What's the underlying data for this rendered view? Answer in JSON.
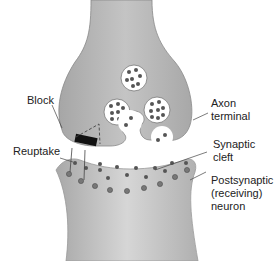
{
  "diagram": {
    "labels": {
      "block": "Block",
      "axon_terminal": "Axon\nterminal",
      "reuptake": "Reuptake",
      "synaptic_cleft": "Synaptic\ncleft",
      "postsynaptic_neuron": "Postsynaptic\n(receiving)\nneuron"
    },
    "colors": {
      "neuron_fill": "#b8b8b8",
      "neuron_shade": "#9e9e9e",
      "vesicle_fill": "#ffffff",
      "neurotransmitter": "#555555",
      "block": "#111111"
    }
  }
}
